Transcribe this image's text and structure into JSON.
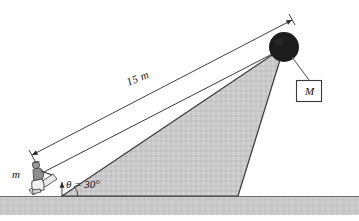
{
  "diagram": {
    "type": "physics-free-body-diagram",
    "labels": {
      "distance": "15 m",
      "angle": "θ = 30°",
      "small_mass": "m",
      "big_mass": "M"
    },
    "values": {
      "incline_length_m": 15,
      "incline_angle_deg": 30
    },
    "colors": {
      "incline_fill": "#c8c8c8",
      "ground_fill": "#c9c9c9",
      "line": "#2b2b2b",
      "pulley": "#1c1c1c",
      "background": "#ffffff"
    },
    "elements": {
      "ramp": "incline-triangle",
      "pulley": "pulley-ball",
      "rope": "rope-line",
      "dimension": "dimension-line",
      "person": "person-on-sled",
      "ground": "ground-strip",
      "hanging_block": "hanging-block-M"
    }
  }
}
